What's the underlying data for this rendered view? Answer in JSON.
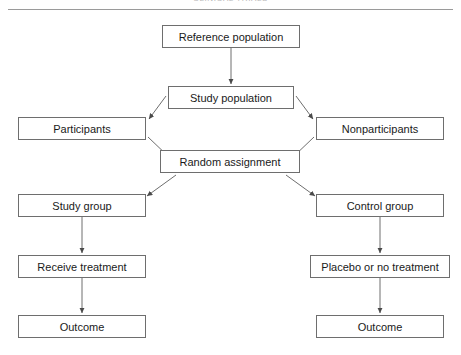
{
  "header": {
    "title": "CLINICAL TRIALS"
  },
  "diagram": {
    "line_color": "#6e6e6e",
    "text_color": "#1a1a1a",
    "background": "#ffffff",
    "nodes": [
      {
        "id": "reference-population",
        "label": "Reference population",
        "x": 162,
        "y": 25,
        "w": 138,
        "h": 23
      },
      {
        "id": "study-population",
        "label": "Study population",
        "x": 168,
        "y": 86,
        "w": 126,
        "h": 23
      },
      {
        "id": "participants",
        "label": "Participants",
        "x": 18,
        "y": 117,
        "w": 128,
        "h": 23
      },
      {
        "id": "nonparticipants",
        "label": "Nonparticipants",
        "x": 316,
        "y": 117,
        "w": 128,
        "h": 23
      },
      {
        "id": "random-assignment",
        "label": "Random assignment",
        "x": 160,
        "y": 150,
        "w": 140,
        "h": 23
      },
      {
        "id": "study-group",
        "label": "Study group",
        "x": 18,
        "y": 194,
        "w": 128,
        "h": 23
      },
      {
        "id": "control-group",
        "label": "Control group",
        "x": 316,
        "y": 194,
        "w": 128,
        "h": 23
      },
      {
        "id": "receive-treatment",
        "label": "Receive treatment",
        "x": 18,
        "y": 255,
        "w": 128,
        "h": 23
      },
      {
        "id": "placebo-or-no-treatment",
        "label": "Placebo or no treatment",
        "x": 310,
        "y": 255,
        "w": 140,
        "h": 23
      },
      {
        "id": "outcome-study",
        "label": "Outcome",
        "x": 18,
        "y": 315,
        "w": 128,
        "h": 23
      },
      {
        "id": "outcome-control",
        "label": "Outcome",
        "x": 316,
        "y": 315,
        "w": 128,
        "h": 23
      }
    ],
    "edges": [
      {
        "id": "reference-to-study",
        "from": "reference-population",
        "to": "study-population",
        "kind": "vertical"
      },
      {
        "id": "study-to-participants",
        "from": "study-population",
        "to": "participants",
        "kind": "diagonal"
      },
      {
        "id": "study-to-nonparticipants",
        "from": "study-population",
        "to": "nonparticipants",
        "kind": "diagonal"
      },
      {
        "id": "participants-to-random",
        "from": "participants",
        "to": "random-assignment",
        "kind": "diagonal"
      },
      {
        "id": "nonparticipants-to-random",
        "from": "nonparticipants",
        "to": "random-assignment",
        "kind": "diagonal"
      },
      {
        "id": "random-to-study-group",
        "from": "random-assignment",
        "to": "study-group",
        "kind": "diagonal"
      },
      {
        "id": "random-to-control-group",
        "from": "random-assignment",
        "to": "control-group",
        "kind": "diagonal"
      },
      {
        "id": "study-group-to-treatment",
        "from": "study-group",
        "to": "receive-treatment",
        "kind": "vertical"
      },
      {
        "id": "control-group-to-placebo",
        "from": "control-group",
        "to": "placebo-or-no-treatment",
        "kind": "vertical"
      },
      {
        "id": "treatment-to-outcome",
        "from": "receive-treatment",
        "to": "outcome-study",
        "kind": "vertical"
      },
      {
        "id": "placebo-to-outcome",
        "from": "placebo-or-no-treatment",
        "to": "outcome-control",
        "kind": "vertical"
      }
    ]
  }
}
